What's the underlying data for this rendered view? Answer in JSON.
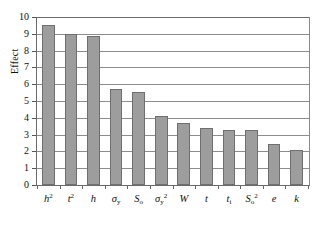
{
  "chart_data": {
    "type": "bar",
    "title": "",
    "xlabel": "",
    "ylabel": "Effect",
    "ylim": [
      0,
      10
    ],
    "ytick_step": 1,
    "grid": true,
    "legend": "none",
    "categories": [
      "h^2",
      "t^2",
      "h",
      "sigma_y",
      "S_o",
      "sigma_y^2",
      "W",
      "t",
      "t_i",
      "S_o^2",
      "e",
      "k"
    ],
    "category_labels_html": [
      "h<sup>2</sup>",
      "t<sup>2</sup>",
      "h",
      "σ<sub>y</sub>",
      "S<sub>o</sub>",
      "σ<sub>y</sub><sup>2</sup>",
      "W",
      "t",
      "t<sub>i</sub>",
      "S<sub>o</sub><sup>2</sup>",
      "e",
      "k"
    ],
    "values": [
      9.5,
      8.97,
      8.85,
      5.7,
      5.55,
      4.12,
      3.7,
      3.42,
      3.3,
      3.27,
      2.45,
      2.08
    ],
    "ytick_labels": [
      "10",
      "9",
      "8",
      "7",
      "6",
      "5",
      "4",
      "3",
      "2",
      "1",
      "0"
    ],
    "ytick_values": [
      10,
      9,
      8,
      7,
      6,
      5,
      4,
      3,
      2,
      1,
      0
    ],
    "colors": {
      "bar_fill": "#9d9d9d",
      "bar_border": "#6f6f6f",
      "gridline": "#8d8d8d",
      "axis": "#6b6b6b",
      "text": "#111111",
      "background": "#ffffff"
    }
  }
}
